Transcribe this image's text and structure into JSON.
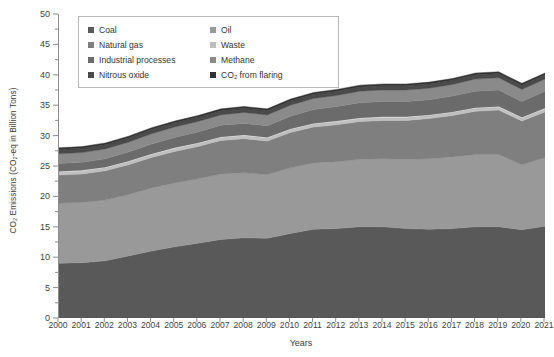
{
  "chart_data": {
    "type": "area",
    "stacked": true,
    "title": "",
    "xlabel": "Years",
    "ylabel": "CO₂ Emissions (CO₂-eq in Billion Tons)",
    "ylim": [
      0,
      50
    ],
    "ytick_step": 5,
    "yticks": [
      0,
      5,
      10,
      15,
      20,
      25,
      30,
      35,
      40,
      45,
      50
    ],
    "grid": false,
    "legend_position": "top-left",
    "categories": [
      2000,
      2001,
      2002,
      2003,
      2004,
      2005,
      2006,
      2007,
      2008,
      2009,
      2010,
      2011,
      2012,
      2013,
      2014,
      2015,
      2016,
      2017,
      2018,
      2019,
      2020,
      2021
    ],
    "series": [
      {
        "name": "Coal",
        "color": "#595959",
        "values": [
          9.0,
          9.1,
          9.4,
          10.2,
          11.0,
          11.7,
          12.3,
          12.9,
          13.2,
          13.1,
          13.9,
          14.6,
          14.7,
          15.0,
          15.0,
          14.7,
          14.6,
          14.7,
          15.0,
          15.0,
          14.5,
          15.1
        ]
      },
      {
        "name": "Oil",
        "color": "#999999",
        "values": [
          9.9,
          9.9,
          10.0,
          10.1,
          10.4,
          10.5,
          10.6,
          10.8,
          10.7,
          10.5,
          10.8,
          10.9,
          11.0,
          11.1,
          11.2,
          11.4,
          11.6,
          11.8,
          11.9,
          11.9,
          10.7,
          11.3
        ]
      },
      {
        "name": "Natural gas",
        "color": "#7f7f7f",
        "values": [
          4.6,
          4.7,
          4.8,
          4.9,
          5.0,
          5.2,
          5.3,
          5.5,
          5.6,
          5.5,
          5.8,
          5.9,
          6.1,
          6.2,
          6.3,
          6.4,
          6.6,
          6.8,
          7.1,
          7.3,
          7.2,
          7.5
        ]
      },
      {
        "name": "Waste",
        "color": "#bfbfbf",
        "values": [
          0.5,
          0.5,
          0.5,
          0.5,
          0.5,
          0.5,
          0.5,
          0.5,
          0.5,
          0.5,
          0.5,
          0.5,
          0.5,
          0.5,
          0.5,
          0.5,
          0.5,
          0.5,
          0.5,
          0.5,
          0.5,
          0.5
        ]
      },
      {
        "name": "Industrial processes",
        "color": "#6b6b6b",
        "values": [
          1.4,
          1.4,
          1.5,
          1.6,
          1.7,
          1.8,
          1.9,
          2.0,
          2.0,
          2.0,
          2.2,
          2.4,
          2.5,
          2.6,
          2.6,
          2.6,
          2.6,
          2.7,
          2.8,
          2.8,
          2.7,
          2.9
        ]
      },
      {
        "name": "Methane",
        "color": "#8a8a8a",
        "values": [
          1.6,
          1.6,
          1.6,
          1.6,
          1.7,
          1.7,
          1.7,
          1.7,
          1.8,
          1.8,
          1.8,
          1.8,
          1.8,
          1.9,
          1.9,
          1.9,
          1.9,
          1.9,
          2.0,
          2.0,
          2.0,
          2.0
        ]
      },
      {
        "name": "Nitrous oxide",
        "color": "#4a4a4a",
        "values": [
          0.7,
          0.7,
          0.7,
          0.7,
          0.7,
          0.7,
          0.7,
          0.7,
          0.7,
          0.7,
          0.7,
          0.7,
          0.7,
          0.7,
          0.7,
          0.7,
          0.7,
          0.7,
          0.7,
          0.7,
          0.7,
          0.7
        ]
      },
      {
        "name": "CO₂ from flaring",
        "color": "#333333",
        "values": [
          0.3,
          0.3,
          0.3,
          0.3,
          0.3,
          0.3,
          0.3,
          0.3,
          0.3,
          0.3,
          0.3,
          0.3,
          0.3,
          0.3,
          0.3,
          0.3,
          0.3,
          0.3,
          0.3,
          0.3,
          0.3,
          0.3
        ]
      }
    ],
    "totals": [
      28.0,
      28.2,
      28.8,
      29.9,
      31.3,
      32.4,
      33.3,
      34.4,
      34.8,
      34.4,
      36.0,
      37.1,
      37.6,
      38.3,
      38.5,
      38.5,
      38.8,
      39.4,
      40.3,
      40.5,
      38.6,
      41.3
    ]
  },
  "legend": {
    "items": [
      {
        "label": "Coal"
      },
      {
        "label": "Oil"
      },
      {
        "label": "Natural gas"
      },
      {
        "label": "Waste"
      },
      {
        "label": "Industrial processes"
      },
      {
        "label": "Methane"
      },
      {
        "label": "Nitrous oxide"
      },
      {
        "label": "CO₂ from flaring"
      }
    ]
  }
}
